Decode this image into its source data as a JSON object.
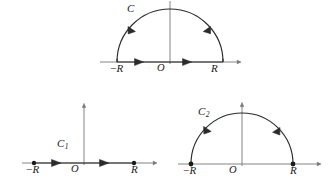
{
  "figure_set": {
    "title": "Semicircular contour diagrams in the complex plane",
    "stroke_color": "#2b2b2b",
    "axis_color": "#6f6f6f",
    "background": "#ffffff"
  },
  "figures": [
    {
      "id": "top-contour",
      "name": "closed-semicircular-contour",
      "curve_label": "C",
      "curve_label_sub": "",
      "origin_label": "O",
      "left_tick_minus": "−",
      "left_tick_label": "R",
      "right_tick_label": "R",
      "has_arc": true,
      "has_segment": true,
      "arc_arrow_count": 2,
      "segment_arrow_count": 2,
      "endpoint_dots": false,
      "orientation": "counterclockwise",
      "geometry": {
        "center_x": 170,
        "baseline_y": 62,
        "radius": 53,
        "axis_x_start": 100,
        "axis_x_end": 240,
        "axis_y_top": 1
      }
    },
    {
      "id": "bottom-left-contour",
      "name": "real-axis-segment-contour",
      "curve_label": "C",
      "curve_label_sub": "1",
      "origin_label": "O",
      "left_tick_minus": "−",
      "left_tick_label": "R",
      "right_tick_label": "R",
      "has_arc": false,
      "has_segment": true,
      "arc_arrow_count": 0,
      "segment_arrow_count": 2,
      "endpoint_dots": true,
      "orientation": "left-to-right",
      "geometry": {
        "center_x": 84,
        "baseline_y": 163,
        "radius": 50,
        "axis_x_start": 22,
        "axis_x_end": 156,
        "axis_y_top": 102
      }
    },
    {
      "id": "bottom-right-contour",
      "name": "semicircular-arc-contour",
      "curve_label": "C",
      "curve_label_sub": "2",
      "origin_label": "O",
      "left_tick_minus": "−",
      "left_tick_label": "R",
      "right_tick_label": "R",
      "has_arc": true,
      "has_segment": false,
      "arc_arrow_count": 2,
      "segment_arrow_count": 0,
      "endpoint_dots": true,
      "orientation": "counterclockwise",
      "geometry": {
        "center_x": 242,
        "baseline_y": 164,
        "radius": 51,
        "axis_x_start": 178,
        "axis_x_end": 320,
        "axis_y_top": 102
      }
    }
  ]
}
